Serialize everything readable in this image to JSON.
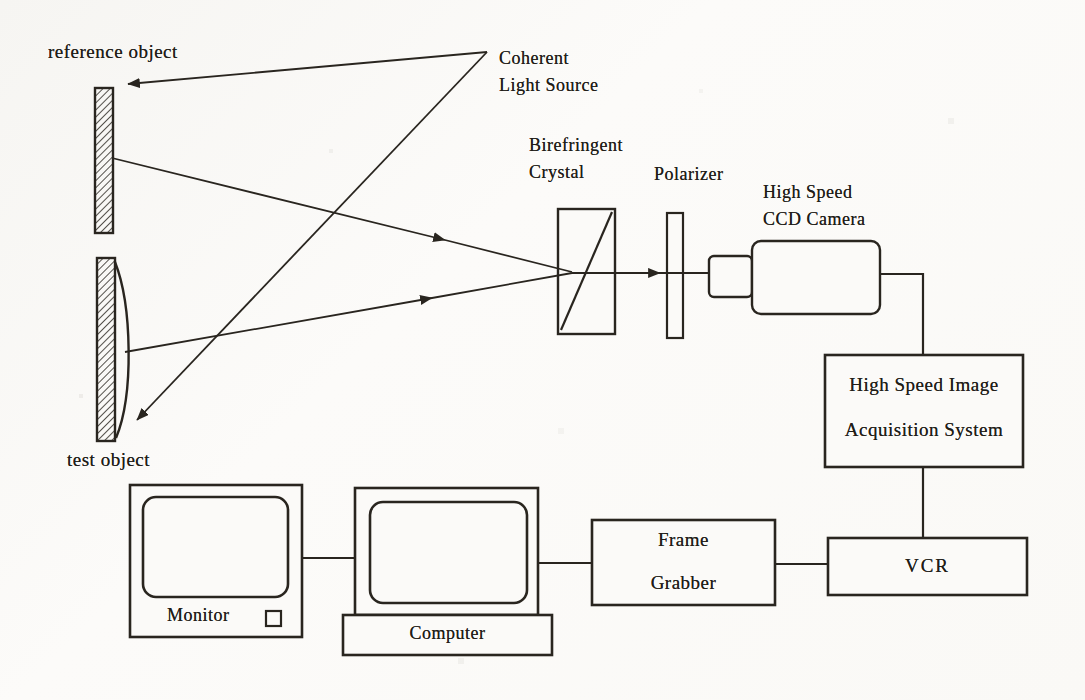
{
  "colors": {
    "paper": "#fbfaf8",
    "ink": "#29251f"
  },
  "labels": {
    "reference_object": "reference object",
    "test_object": "test object",
    "coherent_1": "Coherent",
    "coherent_2": "Light Source",
    "birefringent_1": "Birefringent",
    "birefringent_2": "Crystal",
    "polarizer": "Polarizer",
    "camera_1": "High Speed",
    "camera_2": "CCD Camera",
    "acquisition_1": "High Speed Image",
    "acquisition_2": "Acquisition System",
    "vcr": "VCR",
    "frame_grabber_1": "Frame",
    "frame_grabber_2": "Grabber",
    "monitor": "Monitor",
    "computer": "Computer"
  }
}
